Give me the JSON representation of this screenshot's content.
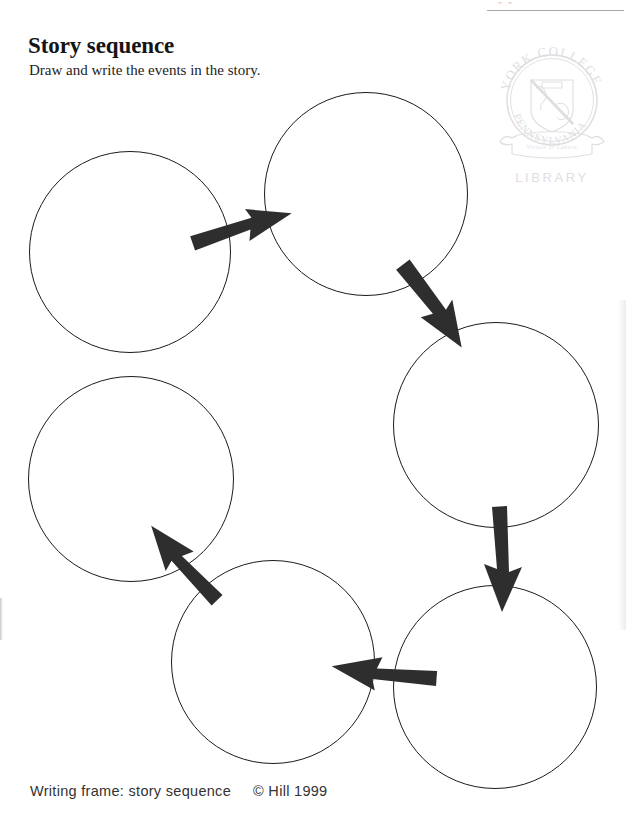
{
  "page": {
    "width": 626,
    "height": 817,
    "background": "#ffffff",
    "ink_color": "#1b1b1b",
    "arrow_color": "#2e2e2e"
  },
  "header": {
    "marks": "\" \"",
    "rule_visible": true
  },
  "title": "Story sequence",
  "subtitle": "Draw and write the events in the story.",
  "footer": {
    "label": "Writing frame: story sequence",
    "copyright": "© Hill 1999"
  },
  "stamp": {
    "name": "york-college-library-stamp",
    "line_top": "YORK COLLEGE",
    "line_arc": "PENNSYLVANIA",
    "banner_motto": "Virtute et Labore",
    "caption": "LIBRARY",
    "color": "#b9b9bd"
  },
  "diagram": {
    "type": "cycle-sequence",
    "circle_count": 6,
    "arrow_count": 5,
    "circles": [
      {
        "id": "circle-1",
        "order": 1,
        "cx": 130,
        "cy": 252,
        "r": 101
      },
      {
        "id": "circle-2",
        "order": 2,
        "cx": 366,
        "cy": 194,
        "r": 102
      },
      {
        "id": "circle-3",
        "order": 3,
        "cx": 496,
        "cy": 425,
        "r": 103
      },
      {
        "id": "circle-4",
        "order": 4,
        "cx": 495,
        "cy": 687,
        "r": 102
      },
      {
        "id": "circle-5",
        "order": 5,
        "cx": 273,
        "cy": 662,
        "r": 102
      },
      {
        "id": "circle-6",
        "order": 6,
        "cx": 131,
        "cy": 479,
        "r": 103
      }
    ],
    "arrows": [
      {
        "id": "arrow-1-to-2",
        "from": "circle-1",
        "to": "circle-2",
        "x1": 192,
        "y1": 243,
        "x2": 291,
        "y2": 217,
        "direction": "right-up"
      },
      {
        "id": "arrow-2-to-3",
        "from": "circle-2",
        "to": "circle-3",
        "x1": 403,
        "y1": 264,
        "x2": 461,
        "y2": 348,
        "direction": "down-right"
      },
      {
        "id": "arrow-3-to-4",
        "from": "circle-3",
        "to": "circle-4",
        "x1": 500,
        "y1": 508,
        "x2": 500,
        "y2": 612,
        "direction": "down"
      },
      {
        "id": "arrow-4-to-5",
        "from": "circle-4",
        "to": "circle-5",
        "x1": 437,
        "y1": 676,
        "x2": 331,
        "y2": 661,
        "direction": "left"
      },
      {
        "id": "arrow-5-to-6",
        "from": "circle-5",
        "to": "circle-6",
        "x1": 217,
        "y1": 600,
        "x2": 152,
        "y2": 523,
        "direction": "up-left"
      }
    ]
  }
}
